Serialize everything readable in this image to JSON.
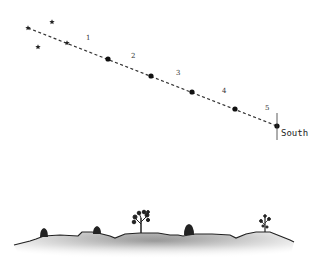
{
  "diagram": {
    "path": {
      "start": [
        28,
        28
      ],
      "end": [
        277,
        126
      ],
      "style": "dashed",
      "color": "#333333"
    },
    "stars": [
      {
        "x": 28,
        "y": 28
      },
      {
        "x": 52,
        "y": 22
      },
      {
        "x": 38,
        "y": 47
      },
      {
        "x": 67,
        "y": 43
      }
    ],
    "points": [
      {
        "label": "1",
        "x": 108,
        "y": 59,
        "label_x": 86,
        "label_y": 40
      },
      {
        "label": "2",
        "x": 151,
        "y": 76,
        "label_x": 131,
        "label_y": 58
      },
      {
        "label": "3",
        "x": 192,
        "y": 92,
        "label_x": 176,
        "label_y": 75
      },
      {
        "label": "4",
        "x": 235,
        "y": 109,
        "label_x": 222,
        "label_y": 93
      },
      {
        "label": "5",
        "x": 277,
        "y": 126,
        "label_x": 265,
        "label_y": 110
      }
    ],
    "direction_marker": {
      "label": "South",
      "x": 277,
      "tick_top": 115,
      "tick_bottom": 140,
      "label_x": 282,
      "label_y": 136
    },
    "landscape": {
      "ground_color": "#888888",
      "line_color": "#222222",
      "features": [
        {
          "type": "bush",
          "x": 44,
          "y": 236
        },
        {
          "type": "bush",
          "x": 97,
          "y": 233
        },
        {
          "type": "tree",
          "x": 141,
          "y": 230
        },
        {
          "type": "bush",
          "x": 189,
          "y": 232
        },
        {
          "type": "tree",
          "x": 265,
          "y": 230
        }
      ]
    }
  }
}
